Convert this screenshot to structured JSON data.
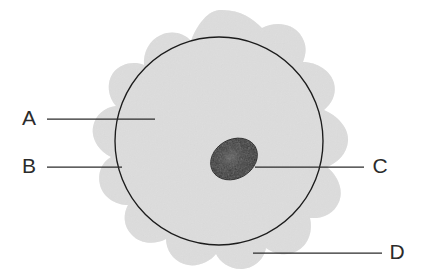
{
  "diagram": {
    "canvas": {
      "width": 422,
      "height": 276,
      "background": "#ffffff"
    },
    "structures": {
      "cell_membrane": {
        "name": "cell-membrane-blob",
        "shape": "lobed-blob",
        "fill": "#e2e2e2",
        "stroke": "none",
        "bounds": {
          "x": 86,
          "y": 10,
          "width": 266,
          "height": 258
        }
      },
      "inner_circle": {
        "name": "inner-membrane-circle",
        "shape": "circle",
        "fill": "none",
        "stroke": "#1c1c1c",
        "stroke_width": 1.3,
        "center": {
          "x": 219,
          "y": 141
        },
        "radius": 104
      },
      "nucleus": {
        "name": "nucleus-ellipse",
        "shape": "ellipse",
        "fill": "#1a1a1a",
        "highlight": "#4a4a4a",
        "center": {
          "x": 234,
          "y": 159
        },
        "rx": 24,
        "ry": 19,
        "rotation_deg": -30
      }
    },
    "labels": [
      {
        "id": "A",
        "name": "label-a",
        "text": "A",
        "text_x": 29,
        "text_y": 119,
        "leader": {
          "x1": 47,
          "y1": 119,
          "x2": 155,
          "y2": 119
        },
        "refers_to": "cytoplasm"
      },
      {
        "id": "B",
        "name": "label-b",
        "text": "B",
        "text_x": 29,
        "text_y": 167,
        "leader": {
          "x1": 47,
          "y1": 167,
          "x2": 122,
          "y2": 167
        },
        "refers_to": "inner-membrane-circle"
      },
      {
        "id": "C",
        "name": "label-c",
        "text": "C",
        "text_x": 380,
        "text_y": 167,
        "leader": {
          "x1": 255,
          "y1": 167,
          "x2": 364,
          "y2": 167
        },
        "refers_to": "nucleus"
      },
      {
        "id": "D",
        "name": "label-d",
        "text": "D",
        "text_x": 397,
        "text_y": 253,
        "leader": {
          "x1": 253,
          "y1": 253,
          "x2": 382,
          "y2": 253
        },
        "refers_to": "cell-membrane-blob"
      }
    ],
    "colors": {
      "cytoplasm": "#e2e2e2",
      "outline": "#1c1c1c",
      "nucleus": "#1a1a1a",
      "label_text": "#2b2b2b",
      "leader_line": "#2b2b2b",
      "background": "#ffffff"
    }
  }
}
